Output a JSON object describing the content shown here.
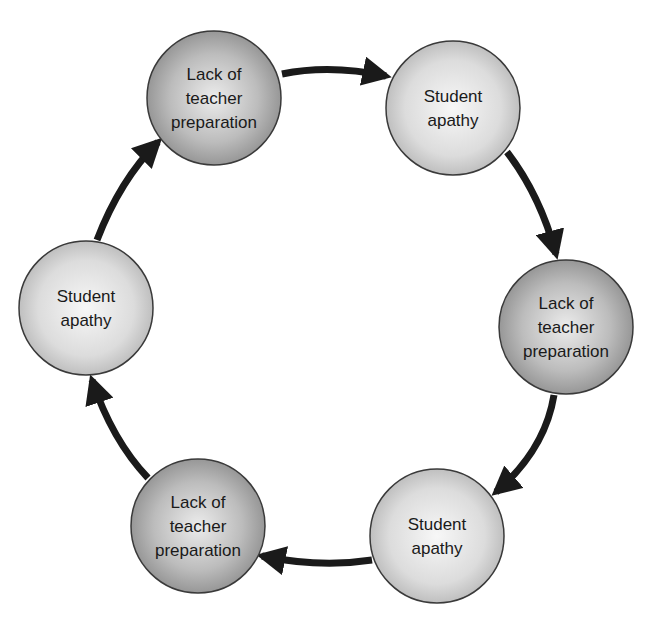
{
  "diagram": {
    "type": "cycle",
    "nodes": [
      {
        "id": "n1",
        "lines": [
          "Lack of",
          "teacher",
          "preparation"
        ],
        "shade": "dark",
        "cx": 214,
        "cy": 98
      },
      {
        "id": "n2",
        "lines": [
          "Student",
          "apathy"
        ],
        "shade": "light",
        "cx": 453,
        "cy": 108
      },
      {
        "id": "n3",
        "lines": [
          "Lack of",
          "teacher",
          "preparation"
        ],
        "shade": "dark",
        "cx": 566,
        "cy": 327
      },
      {
        "id": "n4",
        "lines": [
          "Student",
          "apathy"
        ],
        "shade": "light",
        "cx": 437,
        "cy": 536
      },
      {
        "id": "n5",
        "lines": [
          "Lack of",
          "teacher",
          "preparation"
        ],
        "shade": "dark",
        "cx": 198,
        "cy": 526
      },
      {
        "id": "n6",
        "lines": [
          "Student",
          "apathy"
        ],
        "shade": "light",
        "cx": 86,
        "cy": 308
      }
    ],
    "edges": [
      {
        "from": "n1",
        "to": "n2"
      },
      {
        "from": "n2",
        "to": "n3"
      },
      {
        "from": "n3",
        "to": "n4"
      },
      {
        "from": "n4",
        "to": "n5"
      },
      {
        "from": "n5",
        "to": "n6"
      },
      {
        "from": "n6",
        "to": "n1"
      }
    ],
    "colors": {
      "dark_edge": "#8e8e8e",
      "dark_center": "#e6e6e6",
      "light_edge": "#bdbdbd",
      "light_center": "#f4f4f4",
      "arrow": "#1a1a1a",
      "outline": "#3a3a3a"
    }
  }
}
